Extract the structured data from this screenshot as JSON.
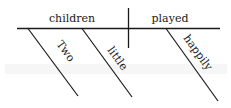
{
  "diagram": {
    "type": "sentence-diagram",
    "sentence": "Two little children played happily",
    "subject": {
      "label": "children"
    },
    "predicate": {
      "label": "played"
    },
    "modifiers": [
      {
        "label": "Two",
        "modifies": "children"
      },
      {
        "label": "little",
        "modifies": "children"
      },
      {
        "label": "happily",
        "modifies": "played"
      }
    ],
    "colors": {
      "ink": "#1a1a1a",
      "background": "#ffffff"
    }
  }
}
